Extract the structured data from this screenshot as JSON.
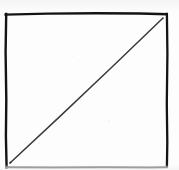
{
  "figure": {
    "background_color": "#fdfdfd",
    "ink_color": "#141414",
    "diagonal_color": "#3a3a3a",
    "bottom_edge_color": "#7d7d80",
    "canvas": {
      "width": 179,
      "height": 170
    },
    "square": {
      "name": "square-outline",
      "left": 6,
      "top": 14,
      "right": 167,
      "bottom": 167,
      "stroke_width": 2.4
    },
    "diagonal": {
      "name": "diagonal-line",
      "x1": 10,
      "y1": 163,
      "x2": 163,
      "y2": 18,
      "stroke_width": 1.5,
      "direction": "bottom-left-to-top-right"
    }
  }
}
